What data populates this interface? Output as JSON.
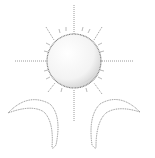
{
  "illustration": {
    "subject": "sun with two crescent moons",
    "style": "stippled line drawing",
    "colors": {
      "background": "#ffffff",
      "stroke": "#8c8c8c",
      "sun_fill_light": "#fbfbfb",
      "sun_fill_shade": "#d9d9d9"
    },
    "elements": [
      {
        "name": "sun",
        "icon": "sun-icon"
      },
      {
        "name": "left-crescent",
        "icon": "crescent-moon-icon"
      },
      {
        "name": "right-crescent",
        "icon": "crescent-moon-icon"
      }
    ]
  }
}
